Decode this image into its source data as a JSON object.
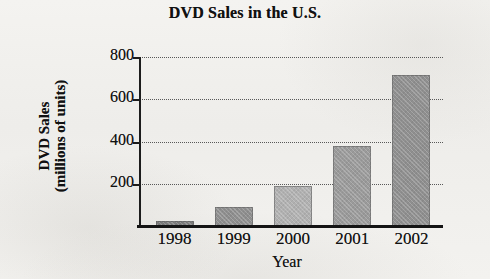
{
  "chart_data": {
    "type": "bar",
    "title": "DVD Sales in the U.S.",
    "xlabel": "Year",
    "ylabel": "DVD Sales\n(millions of units)",
    "ylabel_line1": "DVD Sales",
    "ylabel_line2": "(millions of units)",
    "categories": [
      "1998",
      "1999",
      "2000",
      "2001",
      "2002"
    ],
    "values": [
      25,
      90,
      190,
      380,
      715
    ],
    "series": [
      {
        "name": "DVD Sales",
        "values": [
          25,
          90,
          190,
          380,
          715
        ]
      }
    ],
    "ylim": [
      0,
      800
    ],
    "yticks": [
      200,
      400,
      600,
      800
    ],
    "ytick_labels": [
      "200",
      "400",
      "600",
      "800"
    ],
    "grid": "horizontal-dotted",
    "legend": "none",
    "bar_colors": [
      "#7d7d7d",
      "#8e8e8e",
      "#b0b0b0",
      "#9a9a9a",
      "#8f8f8f"
    ],
    "axis_color": "#141414",
    "gridline_color": "#585858",
    "background_color": "#f2f1ee"
  }
}
